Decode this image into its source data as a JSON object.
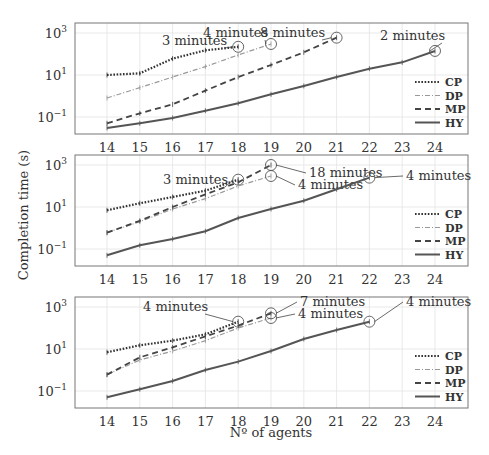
{
  "chart_data": [
    {
      "type": "line",
      "panel": 1,
      "x": [
        14,
        15,
        16,
        17,
        18,
        19,
        20,
        21,
        22,
        23,
        24
      ],
      "yscale": "log",
      "ylim": [
        0.01,
        2000
      ],
      "yticks": [
        "10^3",
        "10^1",
        "10^-1"
      ],
      "grid": true,
      "legend_position": "lower right",
      "series": [
        {
          "name": "CP",
          "style": "dotted",
          "values": [
            10,
            12,
            60,
            150,
            220,
            null,
            null,
            null,
            null,
            null,
            null
          ],
          "timeout": {
            "x": 18,
            "label": "3 minutes"
          }
        },
        {
          "name": "DP",
          "style": "dashdot",
          "values": [
            0.8,
            2.5,
            8,
            25,
            90,
            300,
            null,
            null,
            null,
            null,
            null
          ],
          "timeout": {
            "x": 19,
            "label": "4 minutes"
          }
        },
        {
          "name": "MP",
          "style": "dashed",
          "values": [
            0.05,
            0.15,
            0.4,
            1.8,
            8,
            30,
            120,
            600,
            null,
            null,
            null
          ],
          "timeout": {
            "x": 21,
            "label": "8 minutes"
          }
        },
        {
          "name": "HY",
          "style": "solid",
          "values": [
            0.03,
            0.05,
            0.09,
            0.2,
            0.45,
            1.2,
            3,
            8,
            20,
            40,
            140
          ],
          "timeout": {
            "x": 24,
            "label": "2 minutes"
          }
        }
      ]
    },
    {
      "type": "line",
      "panel": 2,
      "x": [
        14,
        15,
        16,
        17,
        18,
        19,
        20,
        21,
        22,
        23,
        24
      ],
      "yscale": "log",
      "ylim": [
        0.01,
        2000
      ],
      "yticks": [
        "10^3",
        "10^1",
        "10^-1"
      ],
      "grid": true,
      "legend_position": "lower right",
      "series": [
        {
          "name": "CP",
          "style": "dotted",
          "values": [
            7,
            15,
            30,
            60,
            200,
            null,
            null,
            null,
            null,
            null,
            null
          ],
          "timeout": {
            "x": 18,
            "label": "3 minutes"
          }
        },
        {
          "name": "DP",
          "style": "dashdot",
          "values": [
            0.6,
            2,
            8,
            25,
            100,
            300,
            null,
            null,
            null,
            null,
            null
          ],
          "timeout": {
            "x": 19,
            "label": "4 minutes"
          }
        },
        {
          "name": "MP",
          "style": "dashed",
          "values": [
            0.6,
            2.2,
            10,
            40,
            150,
            1000,
            null,
            null,
            null,
            null,
            null
          ],
          "timeout": {
            "x": 19,
            "label": "18 minutes"
          }
        },
        {
          "name": "HY",
          "style": "solid",
          "values": [
            0.05,
            0.15,
            0.3,
            0.7,
            3,
            8,
            20,
            70,
            250,
            null,
            null
          ],
          "timeout": {
            "x": 22,
            "label": "4 minutes"
          }
        }
      ]
    },
    {
      "type": "line",
      "panel": 3,
      "x": [
        14,
        15,
        16,
        17,
        18,
        19,
        20,
        21,
        22,
        23,
        24
      ],
      "yscale": "log",
      "ylim": [
        0.01,
        2000
      ],
      "yticks": [
        "10^3",
        "10^1",
        "10^-1"
      ],
      "grid": true,
      "legend_position": "lower right",
      "series": [
        {
          "name": "CP",
          "style": "dotted",
          "values": [
            7,
            15,
            25,
            50,
            200,
            null,
            null,
            null,
            null,
            null,
            null
          ],
          "timeout": {
            "x": 18,
            "label": "4 minutes"
          }
        },
        {
          "name": "DP",
          "style": "dashdot",
          "values": [
            0.6,
            3,
            8,
            25,
            100,
            300,
            null,
            null,
            null,
            null,
            null
          ],
          "timeout": {
            "x": 19,
            "label": "4 minutes"
          }
        },
        {
          "name": "MP",
          "style": "dashed",
          "values": [
            0.6,
            4,
            12,
            40,
            130,
            500,
            null,
            null,
            null,
            null,
            null
          ],
          "timeout": {
            "x": 19,
            "label": "7 minutes"
          }
        },
        {
          "name": "HY",
          "style": "solid",
          "values": [
            0.05,
            0.12,
            0.3,
            1,
            2.5,
            8,
            30,
            80,
            200,
            null,
            null
          ],
          "timeout": {
            "x": 22,
            "label": "4 minutes"
          }
        }
      ]
    }
  ],
  "figure": {
    "ylabel": "Completion time (s)",
    "xlabel": "Nº of agents",
    "xticks": [
      "14",
      "15",
      "16",
      "17",
      "18",
      "19",
      "20",
      "21",
      "22",
      "23",
      "24"
    ],
    "ytick_labels": {
      "t3": "10",
      "t1": "10",
      "tm1": "10",
      "e3": "3",
      "e1": "1",
      "em1": "−1"
    },
    "legend": [
      "CP",
      "DP",
      "MP",
      "HY"
    ]
  }
}
